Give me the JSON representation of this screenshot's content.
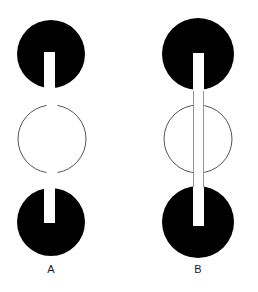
{
  "figure": {
    "title": "",
    "background_color": "#ffffff",
    "width": 258,
    "height": 292,
    "disc_color": "#000000",
    "slot_color": "#ffffff",
    "outline_color": "#555555",
    "label_color": "#1a1a1a"
  },
  "panels": [
    {
      "id": "A",
      "label": "A",
      "label_x": 51,
      "label_y": 272,
      "center_x": 51,
      "description": "two black discs each with a short white slot, separated by a thin outline circle with gaps",
      "top_disc": {
        "cx": 51,
        "cy": 54,
        "r": 34,
        "fill": "#000000"
      },
      "bottom_disc": {
        "cx": 51,
        "cy": 222,
        "r": 34,
        "fill": "#000000"
      },
      "outline_circle": {
        "cx": 52,
        "cy": 139,
        "r": 34,
        "stroke": "#555555",
        "stroke_width": 1,
        "gap_top": true,
        "gap_bottom": true
      },
      "slot": {
        "x": 44,
        "y": 52,
        "width": 11,
        "height": 170,
        "fill": "#ffffff"
      },
      "slot_visible_segments": [
        {
          "x": 44,
          "y": 52,
          "width": 11,
          "height": 37
        },
        {
          "x": 44,
          "y": 188,
          "width": 11,
          "height": 35
        }
      ]
    },
    {
      "id": "B",
      "label": "B",
      "label_x": 198,
      "label_y": 272,
      "center_x": 198,
      "description": "two black discs joined by a continuous white bar that passes in front of a thin outline circle",
      "top_disc": {
        "cx": 198,
        "cy": 54,
        "r": 36,
        "fill": "#000000"
      },
      "bottom_disc": {
        "cx": 198,
        "cy": 222,
        "r": 36,
        "fill": "#000000"
      },
      "outline_circle": {
        "cx": 198,
        "cy": 139,
        "r": 34,
        "stroke": "#555555",
        "stroke_width": 1,
        "gap_top": false,
        "gap_bottom": false
      },
      "slot": {
        "x": 193,
        "y": 53,
        "width": 11,
        "height": 173,
        "fill": "#ffffff"
      },
      "slot_visible_segments": [
        {
          "x": 193,
          "y": 53,
          "width": 11,
          "height": 173
        }
      ]
    }
  ]
}
